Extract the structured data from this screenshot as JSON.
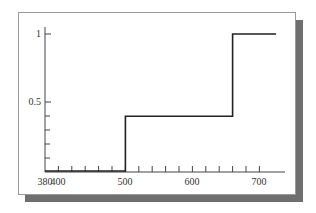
{
  "chart_data": {
    "type": "line",
    "subtype": "step",
    "title": "",
    "xlabel": "",
    "ylabel": "",
    "xlim": [
      380,
      740
    ],
    "ylim": [
      0,
      1.05
    ],
    "x_ticks": [
      380,
      400,
      500,
      600,
      700
    ],
    "x_tick_labels": [
      "380",
      "400",
      "500",
      "600",
      "700"
    ],
    "x_minor_tick_step": 20,
    "y_ticks": [
      0.5,
      1
    ],
    "y_tick_labels": [
      "0.5",
      "1"
    ],
    "y_minor_ticks": [
      0.1,
      0.2,
      0.3,
      0.4
    ],
    "grid": false,
    "legend": null,
    "series": [
      {
        "name": "step function",
        "x": [
          380,
          500,
          500,
          660,
          660,
          725
        ],
        "y": [
          0,
          0,
          0.4,
          0.4,
          1,
          1
        ]
      }
    ]
  },
  "labels": {
    "x380": "380",
    "x400": "400",
    "x500": "500",
    "x600": "600",
    "x700": "700",
    "y05": "0.5",
    "y1": "1"
  }
}
